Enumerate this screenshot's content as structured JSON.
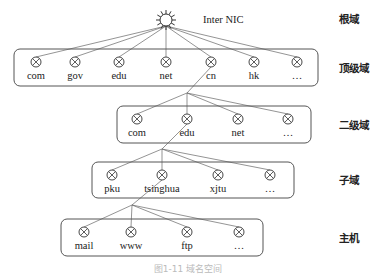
{
  "root": {
    "label": "Inter NIC",
    "level_label": "根域",
    "icon": "sun-icon",
    "x": 166,
    "y": 20
  },
  "levels": [
    {
      "id": "top-level",
      "level_label": "顶级域",
      "box": {
        "x": 14,
        "y": 49,
        "w": 304,
        "h": 37
      },
      "node_y": 62,
      "parent": {
        "x": 166,
        "y": 20
      },
      "nodes": [
        {
          "label": "com",
          "x": 36
        },
        {
          "label": "gov",
          "x": 75
        },
        {
          "label": "edu",
          "x": 119
        },
        {
          "label": "net",
          "x": 166
        },
        {
          "label": "cn",
          "x": 211
        },
        {
          "label": "hk",
          "x": 254
        },
        {
          "label": "…",
          "x": 297
        }
      ]
    },
    {
      "id": "second-level",
      "level_label": "二级域",
      "box": {
        "x": 117,
        "y": 106,
        "w": 194,
        "h": 37
      },
      "node_y": 119,
      "parent": {
        "x": 187,
        "y": 93
      },
      "parent_from": {
        "x": 211,
        "y": 62
      },
      "nodes": [
        {
          "label": "com",
          "x": 137
        },
        {
          "label": "edu",
          "x": 187
        },
        {
          "label": "net",
          "x": 238
        },
        {
          "label": "…",
          "x": 288
        }
      ]
    },
    {
      "id": "sub-domain",
      "level_label": "子域",
      "box": {
        "x": 92,
        "y": 162,
        "w": 202,
        "h": 36
      },
      "node_y": 175,
      "parent": {
        "x": 162,
        "y": 149
      },
      "parent_from": {
        "x": 187,
        "y": 119
      },
      "nodes": [
        {
          "label": "pku",
          "x": 112
        },
        {
          "label": "tsinghua",
          "x": 162
        },
        {
          "label": "xjtu",
          "x": 218
        },
        {
          "label": "…",
          "x": 270
        }
      ]
    },
    {
      "id": "host",
      "level_label": "主机",
      "box": {
        "x": 61,
        "y": 219,
        "w": 202,
        "h": 37
      },
      "node_y": 232,
      "parent": {
        "x": 132,
        "y": 205
      },
      "parent_from": {
        "x": 162,
        "y": 175
      },
      "nodes": [
        {
          "label": "mail",
          "x": 84
        },
        {
          "label": "www",
          "x": 131
        },
        {
          "label": "ftp",
          "x": 187
        },
        {
          "label": "…",
          "x": 239
        }
      ]
    }
  ],
  "level_label_x": 339,
  "caption": "图1-11  域名空间"
}
